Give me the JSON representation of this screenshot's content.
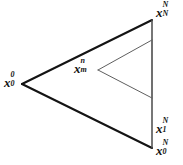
{
  "figure": {
    "type": "geometry-diagram",
    "width": 183,
    "height": 165,
    "background_color": "#ffffff",
    "stroke_color_outer": "#141414",
    "stroke_color_inner": "#595959"
  },
  "labels": {
    "left_vertex": {
      "base": "x",
      "sub": "0",
      "sup": "0",
      "text": "x_0^0"
    },
    "top_right_vertex": {
      "base": "x",
      "sub": "N",
      "sup": "N",
      "text": "x_N^N"
    },
    "bottom_right_upper": {
      "base": "x",
      "sub": "1",
      "sup": "N",
      "text": "x_1^N"
    },
    "bottom_right_vertex": {
      "base": "x",
      "sub": "0",
      "sup": "N",
      "text": "x_0^N"
    },
    "inner_apex": {
      "base": "x",
      "sub": "m",
      "sup": "n",
      "text": "x_m^n"
    }
  },
  "geometry": {
    "outer_triangle": {
      "left_vertex": [
        22,
        84
      ],
      "top_right_vertex": [
        152,
        20
      ],
      "bottom_right_vertex": [
        152,
        148
      ]
    },
    "inner_triangle": {
      "apex": [
        98,
        70
      ],
      "top_right": [
        152,
        40
      ],
      "bottom_right": [
        152,
        98
      ]
    },
    "right_edge": {
      "from": [
        152,
        20
      ],
      "to": [
        152,
        148
      ]
    }
  }
}
